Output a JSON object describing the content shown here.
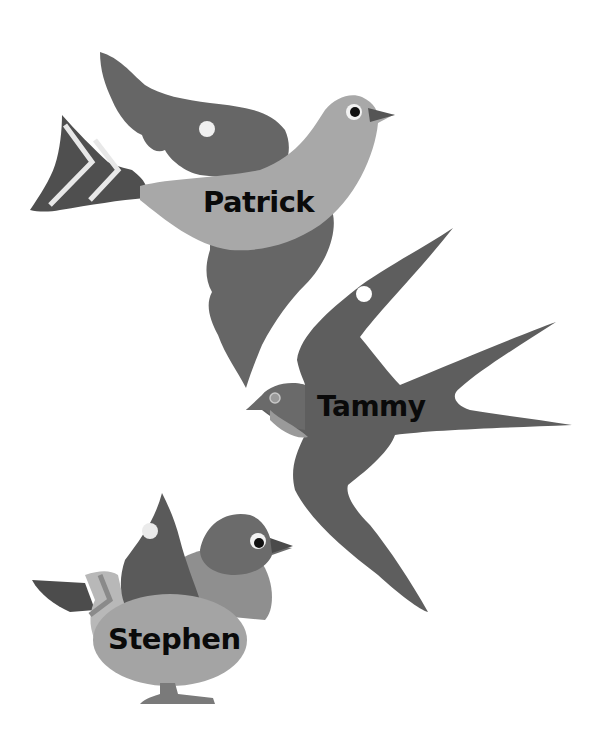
{
  "birds": [
    {
      "name": "Patrick",
      "type": "dove"
    },
    {
      "name": "Tammy",
      "type": "swallow"
    },
    {
      "name": "Stephen",
      "type": "pigeon"
    }
  ],
  "colors": {
    "background": "#ffffff",
    "dark_gray": "#5a5a5a",
    "mid_gray": "#7a7a7a",
    "light_gray": "#a6a6a6",
    "pale_gray": "#bdbdbd",
    "text": "#0a0a0a"
  }
}
